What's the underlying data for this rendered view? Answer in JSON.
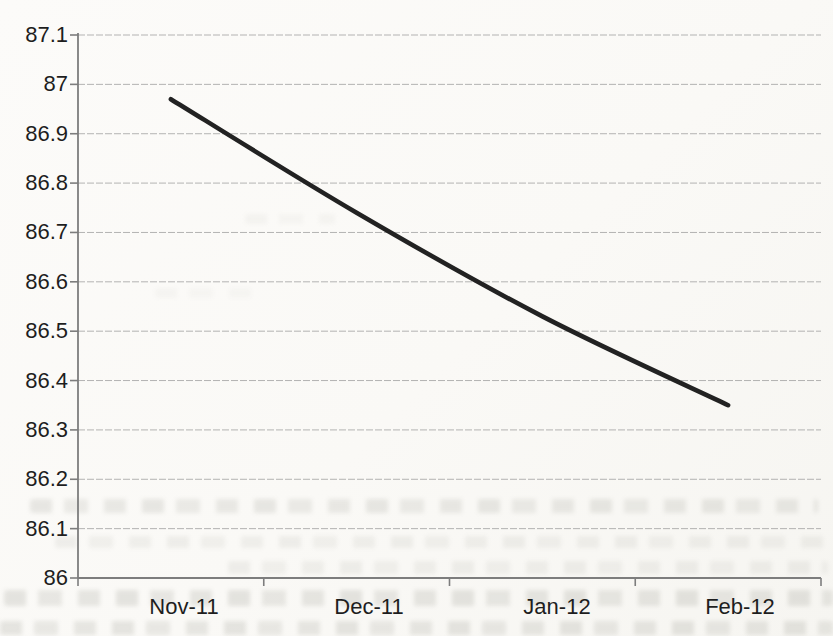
{
  "chart_data": {
    "type": "line",
    "title": "",
    "xlabel": "",
    "ylabel": "",
    "categories": [
      "Nov-11",
      "Dec-11",
      "Jan-12",
      "Feb-12"
    ],
    "values": [
      86.97,
      86.74,
      86.53,
      86.35
    ],
    "ylim": [
      86,
      87.1
    ],
    "ytick_step": 0.1,
    "ytick_labels": [
      "87.1",
      "87",
      "86.9",
      "86.8",
      "86.7",
      "86.6",
      "86.5",
      "86.4",
      "86.3",
      "86.2",
      "86.1",
      "86"
    ],
    "grid": true,
    "legend": "none",
    "colors": {
      "line": "#222222",
      "gridline": "#9b9b9b",
      "axis": "#7d7d7d",
      "labels": "#1e1e1e",
      "paper": "#faf9f6"
    }
  }
}
